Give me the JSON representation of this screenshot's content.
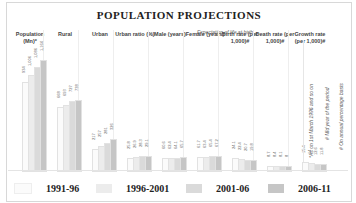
{
  "title": "POPULATION PROJECTIONS",
  "subtitle": "Expectation of life at birth→",
  "legend": [
    {
      "label": "1991-96",
      "color": "#fbfbfb"
    },
    {
      "label": "1996-2001",
      "color": "#ececec"
    },
    {
      "label": "2001-06",
      "color": "#dadada"
    },
    {
      "label": "2006-11",
      "color": "#c6c6c6"
    }
  ],
  "columns": [
    {
      "label": "Population (Mn)*"
    },
    {
      "label": "Rural"
    },
    {
      "label": "Urban"
    },
    {
      "label": "Urban ratio (%)"
    },
    {
      "label": "Male (years)"
    },
    {
      "label": "Female (years)"
    },
    {
      "label": "Birth rate (per 1,000)#"
    },
    {
      "label": "Death rate (per 1,000)#"
    },
    {
      "label": "Growth rate (per 1,000)#"
    }
  ],
  "notes": [
    "*As on 1st March 1996 and so on",
    "# Mid year of the period",
    "# On annual percentage basis"
  ],
  "chart_data": {
    "type": "bar",
    "title": "POPULATION PROJECTIONS",
    "categories": [
      "Population (Mn)*",
      "Rural",
      "Urban",
      "Urban ratio (%)",
      "Male (years)",
      "Female (years)",
      "Birth rate (per 1,000)#",
      "Death rate (per 1,000)#",
      "Growth rate (per 1,000)#"
    ],
    "series": [
      {
        "name": "1991-96",
        "values": [
          934,
          668,
          217,
          25.8,
          60.6,
          61.7,
          24.1,
          8.7,
          15.4
        ]
      },
      {
        "name": "1996-2001",
        "values": [
          1006,
          693,
          257,
          26.9,
          62.4,
          63.4,
          22.4,
          8.4,
          14.0
        ]
      },
      {
        "name": "2001-06",
        "values": [
          1086,
          727,
          281,
          28.3,
          64.1,
          65.4,
          20.7,
          8.1,
          12.6
        ]
      },
      {
        "name": "2006-11",
        "values": [
          1164,
          738,
          326,
          29.1,
          65.7,
          67.2,
          19.8,
          8.0,
          11.8
        ]
      }
    ],
    "xlabel": "",
    "ylabel": "",
    "grid": false,
    "legend_position": "bottom"
  }
}
